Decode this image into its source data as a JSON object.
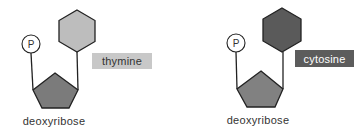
{
  "nucleotides": [
    {
      "phosphate_label": "P",
      "base_label": "thymine",
      "sugar_label": "deoxyribose",
      "colors": {
        "base": "#bdbdbd",
        "sugar": "#7b7b7b",
        "label_bg": "#c8c8c8",
        "label_text": "#333333"
      }
    },
    {
      "phosphate_label": "P",
      "base_label": "cytosine",
      "sugar_label": "deoxyribose",
      "colors": {
        "base": "#5a5a5a",
        "sugar": "#818181",
        "label_bg": "#5c5c5c",
        "label_text": "#ffffff"
      }
    }
  ]
}
